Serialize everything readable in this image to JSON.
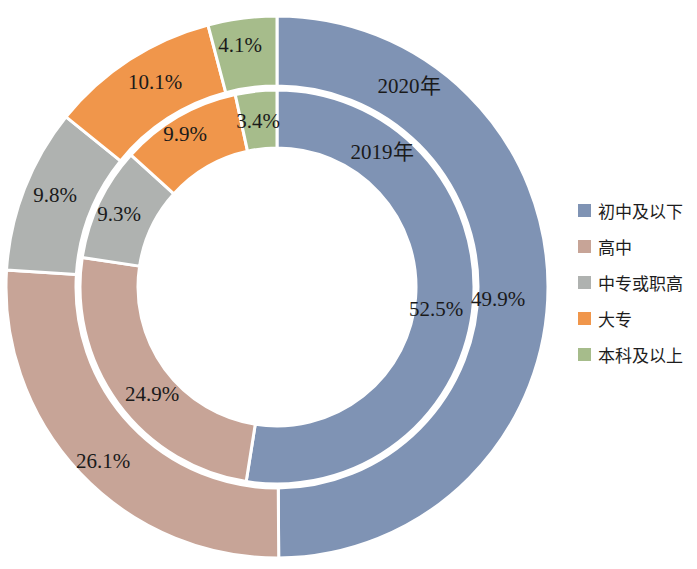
{
  "chart_data": {
    "type": "pie",
    "title": "",
    "subtitle": "",
    "xlabel": "",
    "ylabel": "",
    "legend_position": "right",
    "categories": [
      "初中及以下",
      "高中",
      "中专或职高",
      "大专",
      "本科及以上"
    ],
    "colors": [
      "#7F93B4",
      "#C7A497",
      "#AFB2B0",
      "#F0964B",
      "#A6BC8B"
    ],
    "rings": [
      {
        "name": "2020年",
        "ring": "outer",
        "values": [
          49.9,
          26.1,
          9.8,
          10.1,
          4.1
        ],
        "labels": [
          "49.9%",
          "26.1%",
          "9.8%",
          "10.1%",
          "4.1%"
        ]
      },
      {
        "name": "2019年",
        "ring": "inner",
        "values": [
          52.5,
          24.9,
          9.3,
          9.9,
          3.4
        ],
        "labels": [
          "52.5%",
          "24.9%",
          "9.3%",
          "9.9%",
          "3.4%"
        ]
      }
    ]
  },
  "legend": {
    "items": [
      {
        "label": "初中及以下",
        "color": "#7F93B4"
      },
      {
        "label": "高中",
        "color": "#C7A497"
      },
      {
        "label": "中专或职高",
        "color": "#AFB2B0"
      },
      {
        "label": "大专",
        "color": "#F0964B"
      },
      {
        "label": "本科及以上",
        "color": "#A6BC8B"
      }
    ]
  },
  "annotations": {
    "outer_ring_name": "2020年",
    "inner_ring_name": "2019年"
  }
}
